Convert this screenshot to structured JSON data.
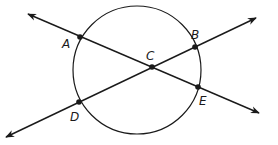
{
  "diagram": {
    "type": "geometry",
    "colors": {
      "stroke": "#1a1a1a",
      "background": "#ffffff"
    },
    "circle": {
      "cx": 137,
      "cy": 70,
      "r": 64
    },
    "lines": [
      {
        "name": "line-AE",
        "from": [
          28,
          14
        ],
        "to": [
          259,
          113
        ],
        "arrows": "both"
      },
      {
        "name": "line-DB",
        "from": [
          6,
          137
        ],
        "to": [
          256,
          18
        ],
        "arrows": "both"
      }
    ],
    "points": [
      {
        "label": "A",
        "x": 80,
        "y": 37,
        "label_x": 62,
        "label_y": 48
      },
      {
        "label": "B",
        "x": 195,
        "y": 47,
        "label_x": 191,
        "label_y": 39
      },
      {
        "label": "C",
        "x": 152,
        "y": 67,
        "label_x": 146,
        "label_y": 60
      },
      {
        "label": "D",
        "x": 79,
        "y": 102,
        "label_x": 70,
        "label_y": 121
      },
      {
        "label": "E",
        "x": 198,
        "y": 87,
        "label_x": 199,
        "label_y": 105
      }
    ]
  }
}
